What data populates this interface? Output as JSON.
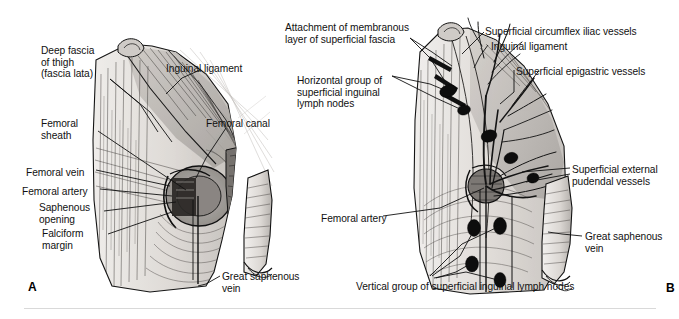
{
  "figure": {
    "panels": [
      {
        "letter": "A",
        "name": "femoral-sheath-and-saphenous-opening",
        "labels": [
          {
            "id": "deep-fascia-of-thigh",
            "text": "Deep fascia\nof thigh\n(fascia lata)",
            "x": 41,
            "y": 45,
            "align": "left"
          },
          {
            "id": "femoral-sheath",
            "text": "Femoral\nsheath",
            "x": 41,
            "y": 118,
            "align": "left"
          },
          {
            "id": "femoral-vein",
            "text": "Femoral vein",
            "x": 26,
            "y": 167,
            "align": "left"
          },
          {
            "id": "femoral-artery",
            "text": "Femoral artery",
            "x": 22,
            "y": 186,
            "align": "left"
          },
          {
            "id": "saphenous-opening",
            "text": "Saphenous\nopening",
            "x": 39,
            "y": 202,
            "align": "left"
          },
          {
            "id": "falciform-margin",
            "text": "Falciform\nmargin",
            "x": 42,
            "y": 228,
            "align": "left"
          },
          {
            "id": "inguinal-ligament",
            "text": "Inguinal ligament",
            "x": 166,
            "y": 63,
            "align": "left"
          },
          {
            "id": "femoral-canal",
            "text": "Femoral canal",
            "x": 206,
            "y": 118,
            "align": "left"
          },
          {
            "id": "great-saphenous-vein",
            "text": "Great saphenous\nvein",
            "x": 222,
            "y": 271,
            "align": "left"
          }
        ]
      },
      {
        "letter": "B",
        "name": "superficial-inguinal-lymph-nodes-and-vessels",
        "labels": [
          {
            "id": "attachment-of-membranous-layer",
            "text": "Attachment of membranous\nlayer of superficial fascia",
            "x": 285,
            "y": 22,
            "align": "left"
          },
          {
            "id": "horizontal-group-lymph-nodes",
            "text": "Horizontal group of\nsuperficial inguinal\nlymph nodes",
            "x": 297,
            "y": 75,
            "align": "left"
          },
          {
            "id": "superficial-circumflex-iliac-vessels",
            "text": "Superficial circumflex iliac vessels",
            "x": 485,
            "y": 26,
            "align": "left"
          },
          {
            "id": "inguinal-ligament-b",
            "text": "Inguinal ligament",
            "x": 491,
            "y": 41,
            "align": "left"
          },
          {
            "id": "superficial-epigastric-vessels",
            "text": "Superficial epigastric vessels",
            "x": 516,
            "y": 66,
            "align": "left"
          },
          {
            "id": "superficial-external-pudendal-vessels",
            "text": "Superficial external\npudendal vessels",
            "x": 572,
            "y": 164,
            "align": "left"
          },
          {
            "id": "femoral-artery-b",
            "text": "Femoral artery",
            "x": 321,
            "y": 213,
            "align": "left"
          },
          {
            "id": "great-saphenous-vein-b",
            "text": "Great saphenous\nvein",
            "x": 585,
            "y": 231,
            "align": "left"
          },
          {
            "id": "vertical-group-lymph-nodes",
            "text": "Vertical group of superficial inguinal lymph nodes",
            "x": 356,
            "y": 281,
            "align": "left"
          }
        ]
      }
    ],
    "colors": {
      "ink": "#111111",
      "fascia_light": "#e9e6e2",
      "fascia_mid": "#cdc9c5",
      "fascia_dark": "#a9a5a1",
      "shadow": "#6e6b68",
      "node_fill": "#0d0d0d",
      "background": "#ffffff",
      "rule": "#d9d9d9"
    }
  }
}
